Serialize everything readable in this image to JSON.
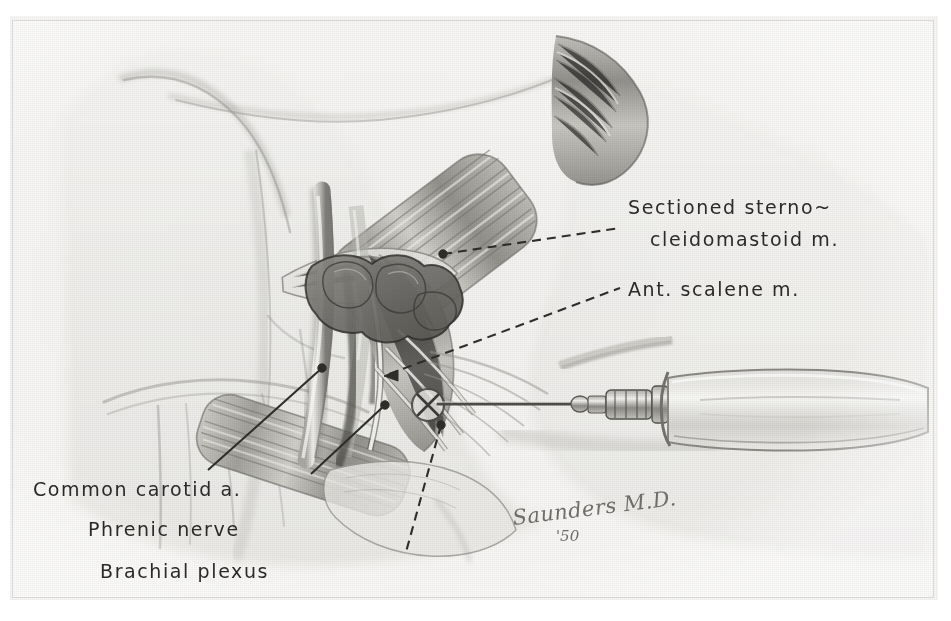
{
  "plate": {
    "type": "anatomical-illustration",
    "subject": "Scalene block — anterior neck dissection with syringe",
    "medium": "grayscale wash and pencil rendering",
    "background_color": "#f6f5f3",
    "ink_color": "#2b2a28"
  },
  "labels": [
    {
      "id": "sectioned-sternocleidomastoid",
      "line1": "Sectioned sterno~",
      "line2": "cleidomastoid m.",
      "x": 628,
      "y": 196,
      "align": "left"
    },
    {
      "id": "ant-scalene",
      "text": "Ant. scalene m.",
      "x": 628,
      "y": 278,
      "align": "left"
    },
    {
      "id": "common-carotid",
      "text": "Common carotid a.",
      "x": 33,
      "y": 478,
      "align": "left"
    },
    {
      "id": "phrenic-nerve",
      "text": "Phrenic nerve",
      "x": 88,
      "y": 518,
      "align": "left"
    },
    {
      "id": "brachial-plexus",
      "text": "Brachial plexus",
      "x": 100,
      "y": 560,
      "align": "left"
    }
  ],
  "leaders": [
    {
      "id": "leader-sternocleidomastoid",
      "style": "dashed",
      "terminal": "dot",
      "from": [
        443,
        254
      ],
      "to": [
        620,
        228
      ]
    },
    {
      "id": "leader-ant-scalene",
      "style": "dashed",
      "terminal": "arrow",
      "from": [
        389,
        374
      ],
      "to": [
        620,
        288
      ]
    },
    {
      "id": "leader-common-carotid",
      "style": "solid",
      "terminal": "dot",
      "from": [
        322,
        368
      ],
      "to": [
        208,
        470
      ]
    },
    {
      "id": "leader-phrenic-nerve",
      "style": "solid",
      "terminal": "dot",
      "from": [
        385,
        405
      ],
      "to": [
        311,
        474
      ]
    },
    {
      "id": "leader-brachial-plexus",
      "style": "dashed",
      "terminal": "dot",
      "from": [
        441,
        425
      ],
      "to": [
        406,
        552
      ]
    }
  ],
  "signature": {
    "name": "Saunders M.D.",
    "year": "'50",
    "x": 512,
    "y": 500
  },
  "annotations": {
    "injection_mark": {
      "id": "injection-target-x",
      "x": 428,
      "y": 405,
      "r": 16,
      "glyph": "X"
    }
  }
}
